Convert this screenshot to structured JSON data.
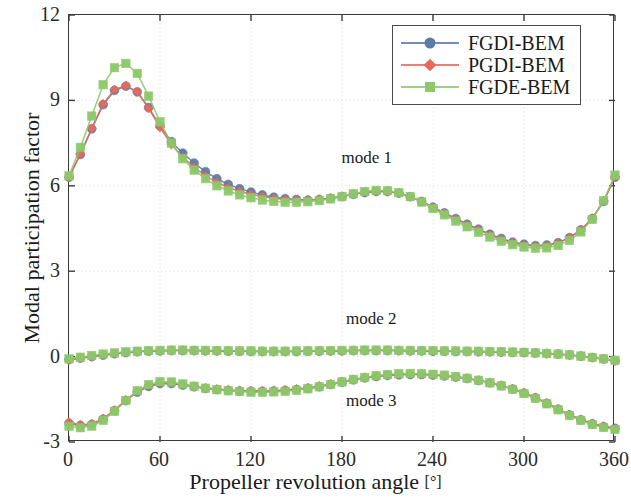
{
  "chart_data": {
    "type": "line",
    "title": "",
    "xlabel": "Propeller revolution angle [°]",
    "ylabel": "Modal participation factor",
    "xlim": [
      0,
      360
    ],
    "ylim": [
      -3,
      12
    ],
    "xticks": [
      "0",
      "60",
      "120",
      "180",
      "240",
      "300",
      "360"
    ],
    "xtick_values": [
      0,
      60,
      120,
      180,
      240,
      300,
      360
    ],
    "yticks": [
      "-3",
      "0",
      "3",
      "6",
      "9",
      "12"
    ],
    "ytick_values": [
      -3,
      0,
      3,
      6,
      9,
      12
    ],
    "grid": true,
    "legend_position": "top-right",
    "legend": [
      "FGDI-BEM",
      "PGDI-BEM",
      "FGDE-BEM"
    ],
    "annotations": [
      {
        "text": "mode 1",
        "x": 197,
        "y": 6.95
      },
      {
        "text": "mode 2",
        "x": 200,
        "y": 1.3
      },
      {
        "text": "mode 3",
        "x": 200,
        "y": -1.6
      }
    ],
    "x": [
      0,
      7.5,
      15,
      22.5,
      30,
      37.5,
      45,
      52.5,
      60,
      67.5,
      75,
      82.5,
      90,
      97.5,
      105,
      112.5,
      120,
      127.5,
      135,
      142.5,
      150,
      157.5,
      165,
      172.5,
      180,
      187.5,
      195,
      202.5,
      210,
      217.5,
      225,
      232.5,
      240,
      247.5,
      255,
      262.5,
      270,
      277.5,
      285,
      292.5,
      300,
      307.5,
      315,
      322.5,
      330,
      337.5,
      345,
      352.5,
      360
    ],
    "series": [
      {
        "name": "FGDI-BEM",
        "color": "#5b7ba8",
        "marker": "circle",
        "mode1": [
          6.3,
          7.1,
          8.0,
          8.85,
          9.35,
          9.5,
          9.3,
          8.75,
          8.1,
          7.55,
          7.15,
          6.8,
          6.5,
          6.25,
          6.05,
          5.9,
          5.78,
          5.68,
          5.6,
          5.55,
          5.52,
          5.5,
          5.52,
          5.56,
          5.62,
          5.7,
          5.76,
          5.8,
          5.8,
          5.74,
          5.62,
          5.45,
          5.25,
          5.05,
          4.85,
          4.65,
          4.48,
          4.3,
          4.15,
          4.02,
          3.95,
          3.9,
          3.92,
          4.0,
          4.18,
          4.45,
          4.85,
          5.45,
          6.3
        ],
        "mode2": [
          -0.1,
          -0.05,
          0.0,
          0.05,
          0.1,
          0.14,
          0.17,
          0.19,
          0.2,
          0.21,
          0.21,
          0.21,
          0.2,
          0.2,
          0.19,
          0.19,
          0.18,
          0.18,
          0.18,
          0.18,
          0.18,
          0.19,
          0.19,
          0.2,
          0.2,
          0.21,
          0.21,
          0.21,
          0.21,
          0.21,
          0.2,
          0.2,
          0.19,
          0.19,
          0.18,
          0.18,
          0.17,
          0.17,
          0.16,
          0.15,
          0.14,
          0.13,
          0.11,
          0.09,
          0.06,
          0.02,
          -0.03,
          -0.08,
          -0.14
        ],
        "mode3": [
          -2.35,
          -2.42,
          -2.38,
          -2.2,
          -1.9,
          -1.55,
          -1.25,
          -1.05,
          -0.95,
          -0.95,
          -1.0,
          -1.06,
          -1.12,
          -1.16,
          -1.19,
          -1.21,
          -1.22,
          -1.22,
          -1.21,
          -1.19,
          -1.16,
          -1.12,
          -1.06,
          -0.98,
          -0.9,
          -0.82,
          -0.75,
          -0.7,
          -0.66,
          -0.64,
          -0.63,
          -0.63,
          -0.65,
          -0.68,
          -0.72,
          -0.77,
          -0.84,
          -0.92,
          -1.02,
          -1.14,
          -1.28,
          -1.45,
          -1.64,
          -1.85,
          -2.05,
          -2.22,
          -2.36,
          -2.46,
          -2.52
        ]
      },
      {
        "name": "PGDI-BEM",
        "color": "#e8695a",
        "marker": "diamond",
        "mode1": [
          6.3,
          7.12,
          8.02,
          8.88,
          9.38,
          9.52,
          9.3,
          8.72,
          8.05,
          7.45,
          7.0,
          6.65,
          6.35,
          6.12,
          5.94,
          5.8,
          5.7,
          5.62,
          5.56,
          5.52,
          5.5,
          5.5,
          5.52,
          5.57,
          5.63,
          5.71,
          5.77,
          5.81,
          5.8,
          5.74,
          5.62,
          5.45,
          5.24,
          5.03,
          4.83,
          4.63,
          4.45,
          4.28,
          4.12,
          4.0,
          3.92,
          3.88,
          3.9,
          3.99,
          4.17,
          4.45,
          4.86,
          5.47,
          6.32
        ],
        "mode2": [
          -0.12,
          -0.06,
          0.0,
          0.06,
          0.11,
          0.15,
          0.18,
          0.2,
          0.21,
          0.22,
          0.22,
          0.21,
          0.21,
          0.2,
          0.2,
          0.19,
          0.19,
          0.18,
          0.18,
          0.18,
          0.19,
          0.19,
          0.2,
          0.2,
          0.21,
          0.21,
          0.22,
          0.22,
          0.22,
          0.21,
          0.21,
          0.2,
          0.2,
          0.19,
          0.19,
          0.18,
          0.18,
          0.17,
          0.16,
          0.15,
          0.14,
          0.12,
          0.1,
          0.08,
          0.05,
          0.01,
          -0.04,
          -0.09,
          -0.15
        ],
        "mode3": [
          -2.3,
          -2.4,
          -2.36,
          -2.18,
          -1.88,
          -1.52,
          -1.22,
          -1.02,
          -0.93,
          -0.93,
          -0.98,
          -1.04,
          -1.1,
          -1.14,
          -1.17,
          -1.19,
          -1.2,
          -1.2,
          -1.19,
          -1.17,
          -1.14,
          -1.09,
          -1.03,
          -0.96,
          -0.88,
          -0.8,
          -0.73,
          -0.68,
          -0.65,
          -0.62,
          -0.61,
          -0.62,
          -0.64,
          -0.67,
          -0.71,
          -0.76,
          -0.83,
          -0.91,
          -1.01,
          -1.13,
          -1.27,
          -1.44,
          -1.63,
          -1.84,
          -2.04,
          -2.21,
          -2.35,
          -2.45,
          -2.52
        ]
      },
      {
        "name": "FGDE-BEM",
        "color": "#8cc96a",
        "marker": "square",
        "mode1": [
          6.35,
          7.35,
          8.45,
          9.55,
          10.15,
          10.3,
          9.95,
          9.15,
          8.25,
          7.5,
          6.95,
          6.55,
          6.25,
          6.0,
          5.82,
          5.68,
          5.58,
          5.5,
          5.45,
          5.42,
          5.42,
          5.44,
          5.48,
          5.54,
          5.62,
          5.72,
          5.8,
          5.84,
          5.83,
          5.76,
          5.62,
          5.43,
          5.2,
          4.98,
          4.76,
          4.56,
          4.37,
          4.2,
          4.05,
          3.93,
          3.85,
          3.81,
          3.82,
          3.9,
          4.08,
          4.38,
          4.82,
          5.48,
          6.38
        ],
        "mode2": [
          -0.08,
          -0.02,
          0.04,
          0.09,
          0.13,
          0.17,
          0.19,
          0.21,
          0.22,
          0.23,
          0.23,
          0.22,
          0.22,
          0.21,
          0.21,
          0.2,
          0.2,
          0.19,
          0.19,
          0.19,
          0.2,
          0.2,
          0.21,
          0.21,
          0.22,
          0.22,
          0.23,
          0.23,
          0.23,
          0.22,
          0.22,
          0.21,
          0.21,
          0.2,
          0.2,
          0.19,
          0.19,
          0.18,
          0.17,
          0.16,
          0.15,
          0.13,
          0.11,
          0.09,
          0.06,
          0.02,
          -0.03,
          -0.08,
          -0.13
        ],
        "mode3": [
          -2.45,
          -2.5,
          -2.44,
          -2.24,
          -1.92,
          -1.54,
          -1.2,
          -0.98,
          -0.88,
          -0.89,
          -0.96,
          -1.04,
          -1.11,
          -1.16,
          -1.2,
          -1.23,
          -1.25,
          -1.25,
          -1.24,
          -1.22,
          -1.18,
          -1.13,
          -1.06,
          -0.98,
          -0.89,
          -0.8,
          -0.73,
          -0.67,
          -0.63,
          -0.6,
          -0.59,
          -0.6,
          -0.62,
          -0.65,
          -0.7,
          -0.76,
          -0.83,
          -0.92,
          -1.03,
          -1.15,
          -1.3,
          -1.47,
          -1.66,
          -1.87,
          -2.07,
          -2.24,
          -2.39,
          -2.49,
          -2.56
        ]
      }
    ]
  }
}
